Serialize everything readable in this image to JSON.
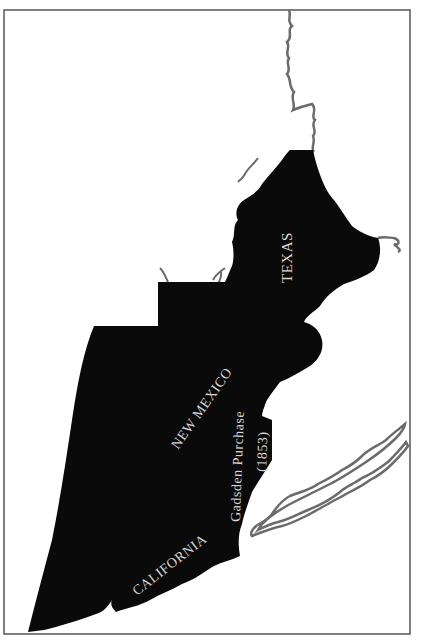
{
  "map": {
    "regions": [
      {
        "id": "texas",
        "label": "TEXAS"
      },
      {
        "id": "new-mexico",
        "label": "NEW MEXICO"
      },
      {
        "id": "gadsden",
        "label": "Gadsden Purchase",
        "sublabel": "(1853)"
      },
      {
        "id": "california",
        "label": "CALIFORNIA"
      }
    ],
    "colors": {
      "territory": "#0a0a0a",
      "river": "#6b6b6b",
      "border": "#555555",
      "background": "#ffffff",
      "label": "#d8d8d8"
    }
  }
}
